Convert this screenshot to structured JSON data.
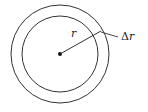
{
  "diagram": {
    "type": "concentric-circles-annulus",
    "labels": {
      "radius": "r",
      "delta_prefix": "Δ",
      "delta_var": "r"
    },
    "geometry": {
      "center": [
        60,
        54
      ],
      "inner_radius": 38,
      "outer_radius": 49
    },
    "colors": {
      "stroke": "#333333",
      "background": "#ffffff"
    }
  }
}
